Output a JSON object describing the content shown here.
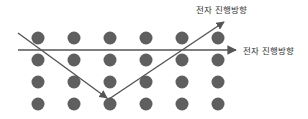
{
  "labels": {
    "diagonal_arrow": "전자 진행방향",
    "horizontal_arrow": "전자 진행방향"
  },
  "colors": {
    "dot": "#5f5f5f",
    "line": "#555555",
    "text": "#333333",
    "background": "#ffffff"
  },
  "lattice": {
    "columns_x": [
      38,
      74,
      110,
      146,
      182,
      218
    ],
    "rows_y": [
      38,
      60,
      82,
      104
    ],
    "dot_radius": 6.5
  }
}
